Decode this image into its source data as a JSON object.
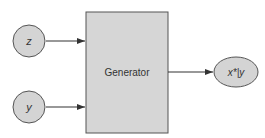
{
  "diagram": {
    "type": "flow",
    "nodes": [
      {
        "id": "z",
        "label": "z",
        "shape": "circle",
        "italic": true
      },
      {
        "id": "y",
        "label": "y",
        "shape": "circle",
        "italic": true
      },
      {
        "id": "generator",
        "label": "Generator",
        "shape": "rectangle"
      },
      {
        "id": "output",
        "label": "x*|y",
        "shape": "ellipse",
        "italic": true
      }
    ],
    "edges": [
      {
        "from": "z",
        "to": "generator"
      },
      {
        "from": "y",
        "to": "generator"
      },
      {
        "from": "generator",
        "to": "output"
      }
    ]
  },
  "colors": {
    "node_fill": "#d4d4d4",
    "box_fill": "#d6d6d6",
    "stroke": "#555555",
    "arrow": "#333333",
    "text": "#333333",
    "background": "#ffffff"
  }
}
